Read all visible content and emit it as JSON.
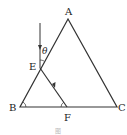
{
  "diagram": {
    "type": "prism-light-path",
    "points": {
      "A": {
        "label": "A",
        "x": 68,
        "y": 19
      },
      "B": {
        "label": "B",
        "x": 20,
        "y": 107
      },
      "C": {
        "label": "C",
        "x": 117,
        "y": 107
      },
      "E": {
        "label": "E",
        "x": 40,
        "y": 68
      },
      "F": {
        "label": "F",
        "x": 67,
        "y": 107
      }
    },
    "angle_label": "θ",
    "colors": {
      "stroke": "#333333",
      "text": "#222222"
    }
  },
  "labels": {
    "A": "A",
    "B": "B",
    "C": "C",
    "E": "E",
    "F": "F",
    "theta": "θ"
  },
  "caption": "图"
}
